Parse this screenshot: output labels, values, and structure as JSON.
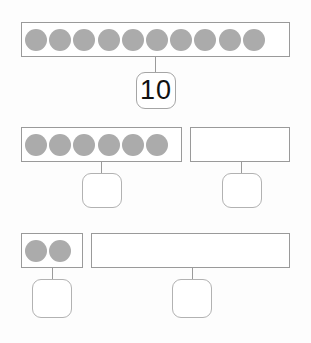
{
  "worksheet": {
    "title": "Number bond decomposition of ten",
    "dot_color": "#ababab",
    "bar_border_color": "#9a9a9a",
    "box_border_color": "#a5a5a5",
    "background_color": "#fdfdfd"
  },
  "rows": [
    {
      "id": "row-whole",
      "bars": [
        {
          "id": "bar-whole",
          "dot_count": 10,
          "label": "whole-bar-ten-dots"
        }
      ],
      "boxes": [
        {
          "id": "box-whole",
          "value": "10",
          "filled": true
        }
      ]
    },
    {
      "id": "row-six-and-four",
      "bars": [
        {
          "id": "bar-six",
          "dot_count": 6,
          "label": "part-bar-six-dots"
        },
        {
          "id": "bar-empty-right",
          "dot_count": 0,
          "label": "part-bar-empty"
        }
      ],
      "boxes": [
        {
          "id": "box-six",
          "value": "",
          "filled": false
        },
        {
          "id": "box-four",
          "value": "",
          "filled": false
        }
      ]
    },
    {
      "id": "row-two-and-eight",
      "bars": [
        {
          "id": "bar-two",
          "dot_count": 2,
          "label": "part-bar-two-dots"
        },
        {
          "id": "bar-empty-long",
          "dot_count": 0,
          "label": "part-bar-empty-long"
        }
      ],
      "boxes": [
        {
          "id": "box-two",
          "value": "",
          "filled": false
        },
        {
          "id": "box-eight",
          "value": "",
          "filled": false
        }
      ]
    }
  ]
}
